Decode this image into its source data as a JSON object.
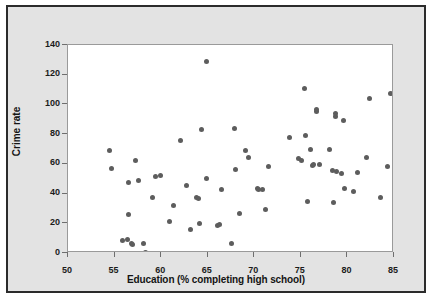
{
  "chart_data": {
    "type": "scatter",
    "title": "",
    "xlabel": "Education (% completing high school)",
    "ylabel": "Crime rate",
    "xlim": [
      50,
      85
    ],
    "ylim": [
      0,
      140
    ],
    "xticks": [
      50,
      55,
      60,
      65,
      70,
      75,
      80,
      85
    ],
    "yticks": [
      0,
      20,
      40,
      60,
      80,
      100,
      120,
      140
    ],
    "grid": false,
    "legend": null,
    "marker_color": "#5d5d5d",
    "points": [
      {
        "x": 54.5,
        "y": 68.9
      },
      {
        "x": 54.7,
        "y": 57.1
      },
      {
        "x": 55.9,
        "y": 8.7
      },
      {
        "x": 56.4,
        "y": 9.3
      },
      {
        "x": 56.5,
        "y": 47.2
      },
      {
        "x": 56.5,
        "y": 25.6
      },
      {
        "x": 56.8,
        "y": 6.2
      },
      {
        "x": 56.9,
        "y": 5.6
      },
      {
        "x": 57.2,
        "y": 62.1
      },
      {
        "x": 57.6,
        "y": 49.1
      },
      {
        "x": 58.1,
        "y": 6.5
      },
      {
        "x": 58.3,
        "y": 0.5
      },
      {
        "x": 59.1,
        "y": 37.3
      },
      {
        "x": 59.4,
        "y": 51.8
      },
      {
        "x": 59.9,
        "y": 52.3
      },
      {
        "x": 60.9,
        "y": 21.1
      },
      {
        "x": 61.3,
        "y": 32.3
      },
      {
        "x": 62.1,
        "y": 76.0
      },
      {
        "x": 62.7,
        "y": 45.1
      },
      {
        "x": 63.1,
        "y": 15.6
      },
      {
        "x": 63.8,
        "y": 37.1
      },
      {
        "x": 64.0,
        "y": 36.7
      },
      {
        "x": 64.1,
        "y": 20.0
      },
      {
        "x": 64.3,
        "y": 82.8
      },
      {
        "x": 64.9,
        "y": 129.0
      },
      {
        "x": 64.9,
        "y": 50.4
      },
      {
        "x": 66.1,
        "y": 18.8
      },
      {
        "x": 66.3,
        "y": 19.2
      },
      {
        "x": 66.5,
        "y": 42.6
      },
      {
        "x": 67.6,
        "y": 6.3
      },
      {
        "x": 67.9,
        "y": 84.0
      },
      {
        "x": 68.0,
        "y": 56.0
      },
      {
        "x": 68.4,
        "y": 26.8
      },
      {
        "x": 69.1,
        "y": 68.9
      },
      {
        "x": 69.4,
        "y": 64.1
      },
      {
        "x": 70.3,
        "y": 43.5
      },
      {
        "x": 70.4,
        "y": 42.8
      },
      {
        "x": 70.9,
        "y": 42.5
      },
      {
        "x": 71.2,
        "y": 29.0
      },
      {
        "x": 71.5,
        "y": 58.3
      },
      {
        "x": 73.8,
        "y": 77.7
      },
      {
        "x": 74.7,
        "y": 63.8
      },
      {
        "x": 75.1,
        "y": 62.0
      },
      {
        "x": 75.4,
        "y": 110.7
      },
      {
        "x": 75.5,
        "y": 78.8
      },
      {
        "x": 75.7,
        "y": 34.9
      },
      {
        "x": 76.0,
        "y": 70.0
      },
      {
        "x": 76.2,
        "y": 58.9
      },
      {
        "x": 76.4,
        "y": 59.7
      },
      {
        "x": 76.7,
        "y": 95.0
      },
      {
        "x": 76.7,
        "y": 96.8
      },
      {
        "x": 77.0,
        "y": 59.3
      },
      {
        "x": 78.1,
        "y": 70.0
      },
      {
        "x": 78.4,
        "y": 55.7
      },
      {
        "x": 78.5,
        "y": 34.2
      },
      {
        "x": 78.7,
        "y": 91.6
      },
      {
        "x": 78.7,
        "y": 94.0
      },
      {
        "x": 78.8,
        "y": 55.1
      },
      {
        "x": 79.4,
        "y": 53.3
      },
      {
        "x": 79.6,
        "y": 88.9
      },
      {
        "x": 79.7,
        "y": 43.4
      },
      {
        "x": 80.6,
        "y": 41.5
      },
      {
        "x": 81.1,
        "y": 54.1
      },
      {
        "x": 82.0,
        "y": 64.1
      },
      {
        "x": 82.4,
        "y": 104.3
      },
      {
        "x": 83.5,
        "y": 37.3
      },
      {
        "x": 84.3,
        "y": 58.2
      },
      {
        "x": 84.6,
        "y": 107.3
      }
    ]
  }
}
